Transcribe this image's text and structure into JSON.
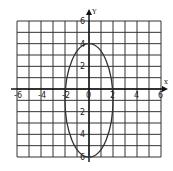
{
  "chart_data": {
    "type": "line",
    "title": "",
    "xlabel": "x",
    "ylabel": "y",
    "xlim": [
      -6,
      6
    ],
    "ylim": [
      -6,
      6
    ],
    "grid": true,
    "x_ticks": [
      -6,
      -4,
      -2,
      0,
      2,
      4,
      6
    ],
    "y_ticks": [
      6,
      4,
      2,
      0,
      -2,
      -4,
      -6
    ],
    "x_tick_labels": [
      "-6",
      "-4",
      "-2",
      "0",
      "2",
      "4",
      "6"
    ],
    "y_tick_labels": [
      "6",
      "4",
      "2",
      "0",
      "2",
      "4",
      "6"
    ],
    "series": [
      {
        "name": "ellipse",
        "shape": "ellipse",
        "center": [
          0,
          -1
        ],
        "semi_axis_x": 2,
        "semi_axis_y": 5,
        "vertices": [
          [
            0,
            4
          ],
          [
            0,
            -6
          ],
          [
            -2,
            -1
          ],
          [
            2,
            -1
          ]
        ]
      }
    ]
  },
  "colors": {
    "grid": "#333333",
    "curve": "#333333",
    "background": "#ffffff"
  }
}
